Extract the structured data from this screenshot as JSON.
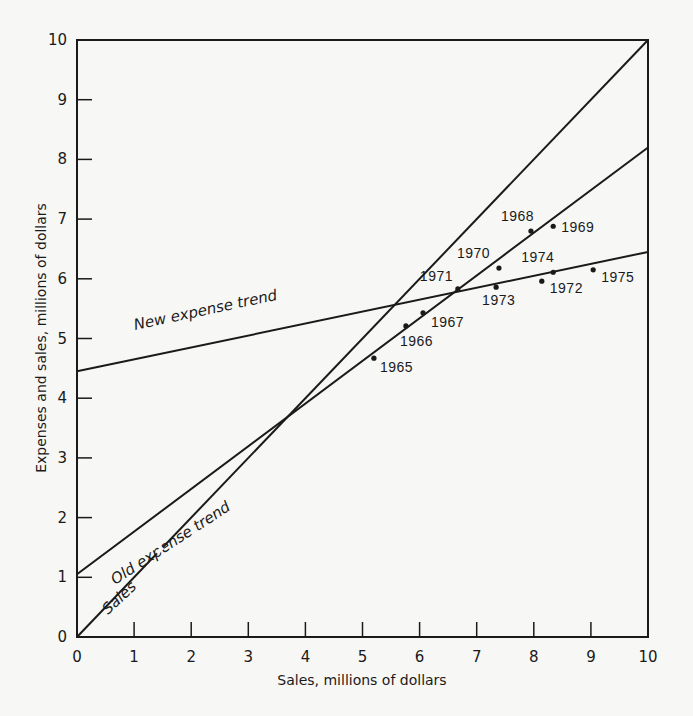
{
  "chart_data": {
    "type": "scatter",
    "title": "",
    "xlabel": "Sales, millions of dollars",
    "ylabel": "Expenses and sales, millions of dollars",
    "xlim": [
      0,
      10
    ],
    "ylim": [
      0,
      10
    ],
    "grid": false,
    "x_ticks": [
      "0",
      "1",
      "2",
      "3",
      "4",
      "5",
      "6",
      "7",
      "8",
      "9",
      "10"
    ],
    "y_ticks": [
      "0",
      "1",
      "2",
      "3",
      "4",
      "5",
      "6",
      "7",
      "8",
      "9",
      "10"
    ],
    "lines": [
      {
        "name": "Sales",
        "label": "Sales",
        "x": [
          0,
          10
        ],
        "y": [
          0,
          10
        ]
      },
      {
        "name": "Old expense trend",
        "label": "Old expense trend",
        "x": [
          0,
          10
        ],
        "y": [
          1.05,
          8.2
        ]
      },
      {
        "name": "New expense trend",
        "label": "New expense trend",
        "x": [
          0,
          10
        ],
        "y": [
          4.45,
          6.45
        ]
      }
    ],
    "points": [
      {
        "label": "1965",
        "x": 5.2,
        "y": 4.67
      },
      {
        "label": "1966",
        "x": 5.76,
        "y": 5.21
      },
      {
        "label": "1967",
        "x": 6.06,
        "y": 5.43
      },
      {
        "label": "1968",
        "x": 7.95,
        "y": 6.8
      },
      {
        "label": "1969",
        "x": 8.34,
        "y": 6.88
      },
      {
        "label": "1970",
        "x": 7.39,
        "y": 6.18
      },
      {
        "label": "1971",
        "x": 6.67,
        "y": 5.83
      },
      {
        "label": "1972",
        "x": 8.14,
        "y": 5.96
      },
      {
        "label": "1973",
        "x": 7.34,
        "y": 5.86
      },
      {
        "label": "1974",
        "x": 8.34,
        "y": 6.11
      },
      {
        "label": "1975",
        "x": 9.04,
        "y": 6.15
      }
    ]
  },
  "colors": {
    "ink": "#1a1a1a",
    "paper": "#f7f7f5"
  }
}
